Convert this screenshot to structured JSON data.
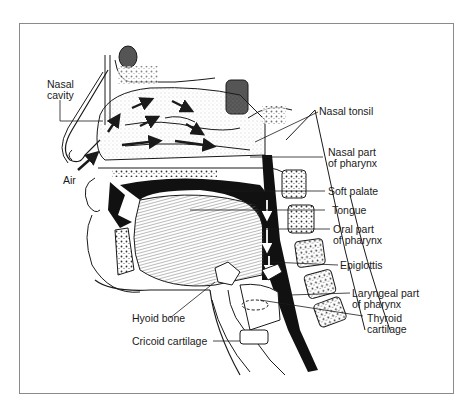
{
  "figure": {
    "labels": {
      "nasal_cavity": "Nasal\ncavity",
      "air": "Air",
      "nasal_tonsil": "Nasal tonsil",
      "nasal_pharynx": "Nasal part\nof pharynx",
      "soft_palate": "Soft palate",
      "tongue": "Tongue",
      "oral_pharynx": "Oral part\nof pharynx",
      "epiglottis": "Epiglottis",
      "laryngeal_pharynx": "Laryngeal part\nof pharynx",
      "thyroid_cartilage": "Thyroid\ncartilage",
      "hyoid_bone": "Hyoid bone",
      "cricoid_cartilage": "Cricoid cartilage"
    },
    "colors": {
      "ink": "#1a1a1a",
      "frame": "#8a8a8a",
      "background": "#ffffff",
      "stipple": "#9a9a9a"
    }
  }
}
